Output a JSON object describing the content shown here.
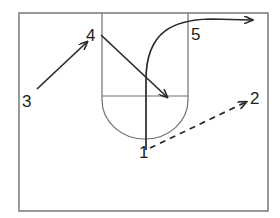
{
  "diagram": {
    "type": "basketball-play",
    "colors": {
      "court_lines": "#6e6e6e",
      "paths": "#2a2a2a",
      "labels": "#1e1e1e",
      "background": "#ffffff"
    },
    "court": {
      "boundary": {
        "x": 19,
        "y": 13,
        "width": 249,
        "height": 198
      },
      "paint": {
        "left": 102,
        "right": 188,
        "top": 13,
        "free_throw_y": 96
      },
      "free_throw_circle_bottom_y": 138
    },
    "players": [
      {
        "id": "1",
        "label": "1",
        "x": 145,
        "y": 154
      },
      {
        "id": "2",
        "label": "2",
        "x": 257,
        "y": 103
      },
      {
        "id": "3",
        "label": "3",
        "x": 28,
        "y": 101
      },
      {
        "id": "4",
        "label": "4",
        "x": 92,
        "y": 39
      },
      {
        "id": "5",
        "label": "5",
        "x": 197,
        "y": 38
      }
    ],
    "movements": [
      {
        "from": "3",
        "to": "4",
        "style": "solid",
        "kind": "cut"
      },
      {
        "from": "4",
        "to": "paint-right-elbow-low",
        "style": "solid",
        "kind": "cut"
      },
      {
        "from": "1",
        "to": "top-right",
        "style": "solid-curve",
        "kind": "cut"
      },
      {
        "from": "1",
        "to": "2",
        "style": "dashed",
        "kind": "pass"
      }
    ]
  }
}
